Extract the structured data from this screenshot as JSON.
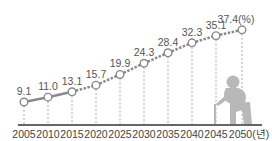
{
  "chart_data": {
    "type": "line",
    "title": "",
    "xlabel": "",
    "ylabel": "",
    "unit_value": "(%)",
    "unit_x": "(년)",
    "categories": [
      "2005",
      "2010",
      "2015",
      "2020",
      "2025",
      "2030",
      "2035",
      "2040",
      "2045",
      "2050"
    ],
    "values": [
      9.1,
      11.0,
      13.1,
      15.7,
      19.9,
      24.3,
      28.4,
      32.3,
      35.1,
      37.4
    ],
    "labels": [
      "9.1",
      "11.0",
      "13.1",
      "15.7",
      "19.9",
      "24.3",
      "28.4",
      "32.3",
      "35.1",
      "37.4(%)"
    ],
    "x_tick_labels": [
      "2005",
      "2010",
      "2015",
      "2020",
      "2025",
      "2030",
      "2035",
      "2040",
      "2045",
      "2050(년)"
    ],
    "solid_segment_until": "2015",
    "dashed_after": "2015",
    "grid": false,
    "ylim": [
      0,
      40
    ],
    "decoration": "elderly-person-with-cane-silhouette"
  },
  "colors": {
    "line": "#8a8a8a",
    "marker_fill": "#ffffff",
    "marker_stroke": "#8a8a8a",
    "axis": "#666666",
    "text": "#444444",
    "figure": "#b8b8b8"
  }
}
